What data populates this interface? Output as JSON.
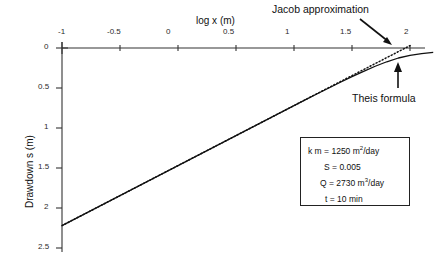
{
  "chart_data": {
    "type": "line",
    "title": "",
    "xlabel": "log x  (m)",
    "ylabel": "Drawdown  s  (m)",
    "xlim": [
      -1.0,
      2.2
    ],
    "ylim": [
      2.5,
      -0.05
    ],
    "y_inverted": true,
    "grid": false,
    "legend_position": "annotations",
    "xticks": [
      "-1",
      "-0.5",
      "0",
      "0.5",
      "1",
      "1.5",
      "2"
    ],
    "xtick_values": [
      -1,
      -0.5,
      0,
      0.5,
      1,
      1.5,
      2
    ],
    "yticks": [
      "0",
      "0.5",
      "1",
      "1.5",
      "2",
      "2.5"
    ],
    "ytick_values": [
      0,
      0.5,
      1,
      1.5,
      2,
      2.5
    ],
    "series": [
      {
        "name": "Theis formula",
        "style": "solid",
        "color": "#111111",
        "x": [
          -1.0,
          -0.9,
          -0.8,
          -0.7,
          -0.6,
          -0.5,
          -0.4,
          -0.3,
          -0.2,
          -0.1,
          0.0,
          0.1,
          0.2,
          0.3,
          0.4,
          0.5,
          0.6,
          0.7,
          0.8,
          0.9,
          1.0,
          1.1,
          1.2,
          1.3,
          1.4,
          1.5,
          1.6,
          1.7,
          1.8,
          1.9,
          2.0,
          2.1,
          2.2
        ],
        "values": [
          2.22,
          2.145,
          2.07,
          1.995,
          1.92,
          1.845,
          1.77,
          1.695,
          1.62,
          1.545,
          1.47,
          1.395,
          1.32,
          1.245,
          1.17,
          1.095,
          1.02,
          0.945,
          0.87,
          0.795,
          0.72,
          0.645,
          0.572,
          0.5,
          0.428,
          0.358,
          0.292,
          0.228,
          0.172,
          0.125,
          0.092,
          0.07,
          0.055
        ]
      },
      {
        "name": "Jacob approximation",
        "style": "dotted",
        "color": "#111111",
        "x": [
          -1.0,
          -0.5,
          0.0,
          0.5,
          1.0,
          1.3,
          1.5,
          1.6,
          1.7,
          1.75,
          1.8,
          1.85,
          1.9,
          1.95,
          2.0
        ],
        "values": [
          2.22,
          1.845,
          1.47,
          1.095,
          0.72,
          0.495,
          0.345,
          0.27,
          0.195,
          0.158,
          0.12,
          0.083,
          0.045,
          0.008,
          -0.03
        ]
      }
    ],
    "annotations": [
      {
        "name": "jacob-approximation",
        "text": "Jacob  approximation",
        "arrow": "down-right",
        "points_to_x": 1.9,
        "points_to_y": 0.0
      },
      {
        "name": "theis-formula",
        "text": "Theis  formula",
        "arrow": "up",
        "points_to_x": 1.92,
        "points_to_y": 0.12
      }
    ],
    "parameter_box": [
      {
        "symbol": "k m",
        "eq": "=",
        "value": "1250 m",
        "exp": "2",
        "unit": "/day"
      },
      {
        "symbol": "S",
        "eq": "=",
        "value": "0.005",
        "exp": "",
        "unit": ""
      },
      {
        "symbol": "Q",
        "eq": "=",
        "value": "2730 m",
        "exp": "3",
        "unit": "/day"
      },
      {
        "symbol": "t",
        "eq": "=",
        "value": "10 min",
        "exp": "",
        "unit": ""
      }
    ]
  }
}
